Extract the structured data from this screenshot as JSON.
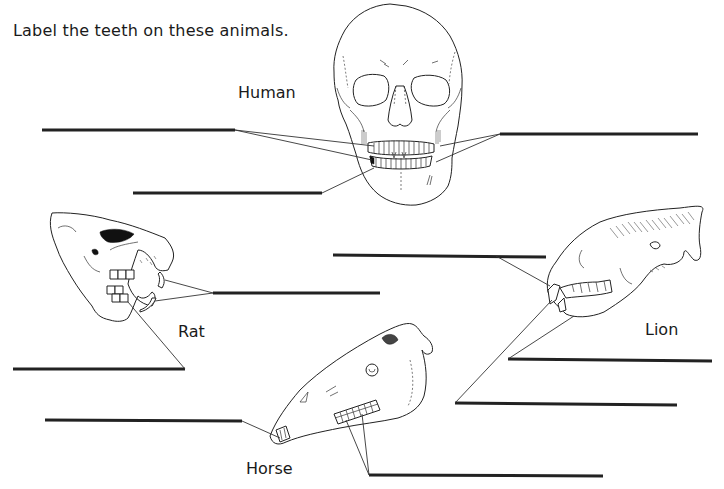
{
  "worksheet": {
    "instruction": "Label the teeth on these animals.",
    "animals": [
      {
        "name": "Human",
        "blanks": 3
      },
      {
        "name": "Rat",
        "blanks": 2
      },
      {
        "name": "Lion",
        "blanks": 3
      },
      {
        "name": "Horse",
        "blanks": 2
      }
    ],
    "labels": {
      "human": "Human",
      "rat": "Rat",
      "lion": "Lion",
      "horse": "Horse"
    },
    "answer_blanks": [
      {
        "id": "human-1",
        "animal": "Human",
        "value": ""
      },
      {
        "id": "human-2",
        "animal": "Human",
        "value": ""
      },
      {
        "id": "human-3",
        "animal": "Human",
        "value": ""
      },
      {
        "id": "rat-1",
        "animal": "Rat",
        "value": ""
      },
      {
        "id": "rat-2",
        "animal": "Rat",
        "value": ""
      },
      {
        "id": "lion-1",
        "animal": "Lion",
        "value": ""
      },
      {
        "id": "lion-2",
        "animal": "Lion",
        "value": ""
      },
      {
        "id": "lion-3",
        "animal": "Lion",
        "value": ""
      },
      {
        "id": "horse-1",
        "animal": "Horse",
        "value": ""
      },
      {
        "id": "horse-2",
        "animal": "Horse",
        "value": ""
      }
    ],
    "colors": {
      "background": "#ffffff",
      "ink": "#1a1a1a"
    }
  }
}
